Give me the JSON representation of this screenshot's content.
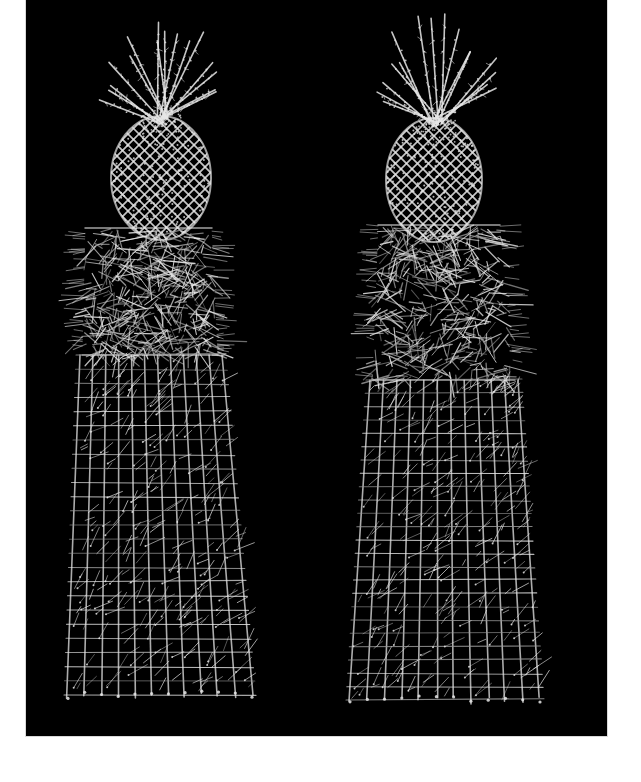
{
  "photo": {
    "alt": "Two wire-mesh sculptures: pineapple finials atop tall tapering square obelisk pedestals, photographed against a black backdrop",
    "background": "#000000",
    "page_background": "#ffffff",
    "wire_color": "#e6e6e6",
    "wire_dim_color": "#9a9a9a",
    "frame": {
      "x": 26,
      "y": 0,
      "width": 581,
      "height": 736
    }
  },
  "sculptures": [
    {
      "name": "left-sculpture",
      "crown": {
        "cx": 161,
        "top": 10,
        "bottom": 120,
        "spread": 58
      },
      "fruit": {
        "cx": 161,
        "cy": 178,
        "rx": 50,
        "ry": 62
      },
      "upper": {
        "topY": 228,
        "botY": 355,
        "topLeft": 85,
        "topRight": 212,
        "botLeft": 82,
        "botRight": 218
      },
      "lower": {
        "topY": 355,
        "botY": 695,
        "topLeft": 80,
        "topRight": 222,
        "botLeft": 68,
        "botRight": 252
      },
      "seed": 7
    },
    {
      "name": "right-sculpture",
      "crown": {
        "cx": 436,
        "top": 14,
        "bottom": 122,
        "spread": 58
      },
      "fruit": {
        "cx": 434,
        "cy": 180,
        "rx": 48,
        "ry": 62
      },
      "upper": {
        "topY": 225,
        "botY": 380,
        "topLeft": 378,
        "topRight": 500,
        "botLeft": 372,
        "botRight": 515
      },
      "lower": {
        "topY": 380,
        "botY": 700,
        "topLeft": 370,
        "topRight": 518,
        "botLeft": 350,
        "botRight": 540
      },
      "seed": 23
    }
  ]
}
